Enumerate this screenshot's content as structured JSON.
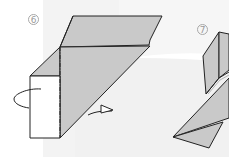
{
  "diagram": {
    "type": "origami-instructions",
    "steps": [
      {
        "number": "6",
        "label": "6",
        "actions": [
          "turn-over",
          "fold-back"
        ]
      },
      {
        "number": "7",
        "label": "7"
      }
    ]
  },
  "colors": {
    "paper_colored": "#c9c9c9",
    "paper_white": "#ffffff",
    "outline": "#222222",
    "background_shape": "#f2f2f2"
  }
}
